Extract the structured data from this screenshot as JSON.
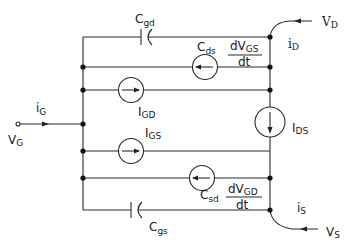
{
  "diagram": {
    "type": "circuit",
    "ports": {
      "gate": {
        "voltage": {
          "main": "V",
          "sub": "G"
        },
        "current": {
          "main": "i",
          "sub": "G"
        }
      },
      "drain": {
        "voltage": {
          "main": "V",
          "sub": "D"
        },
        "current": {
          "main": "i",
          "sub": "D"
        }
      },
      "source": {
        "voltage": {
          "main": "V",
          "sub": "S"
        },
        "current": {
          "main": "i",
          "sub": "S"
        }
      }
    },
    "capacitors": {
      "cgd": {
        "main": "C",
        "sub": "gd"
      },
      "cgs": {
        "main": "C",
        "sub": "gs"
      }
    },
    "sources": {
      "cds": {
        "main": "C",
        "sub": "ds",
        "frac_num_main": "dV",
        "frac_num_sub": "GS",
        "frac_den": "dt",
        "direction": "left"
      },
      "igd": {
        "main": "I",
        "sub": "GD",
        "direction": "right"
      },
      "ids": {
        "main": "I",
        "sub": "DS",
        "direction": "down"
      },
      "igs": {
        "main": "I",
        "sub": "GS",
        "direction": "right"
      },
      "csd": {
        "main": "C",
        "sub": "sd",
        "frac_num_main": "dV",
        "frac_num_sub": "GD",
        "frac_den": "dt",
        "direction": "left"
      }
    }
  }
}
